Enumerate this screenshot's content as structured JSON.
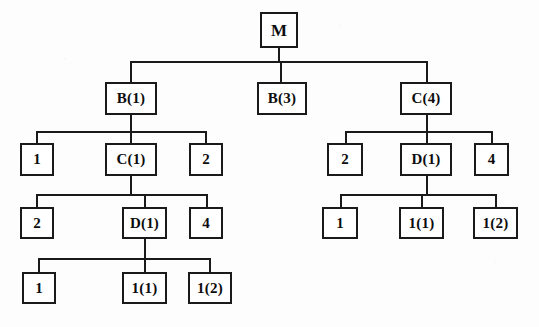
{
  "diagram": {
    "type": "tree",
    "width": 539,
    "height": 327,
    "background_color": "#fdfdfd",
    "line_color": "#1a1a1a",
    "box_fill_color": "#ffffff",
    "text_color": "#0d0d0d",
    "nodes": [
      {
        "id": "m",
        "label": "M",
        "x": 260,
        "y": 12,
        "w": 38,
        "h": 36,
        "font_size": 17
      },
      {
        "id": "b1",
        "label": "B(1)",
        "x": 105,
        "y": 82,
        "w": 52,
        "h": 33,
        "font_size": 15
      },
      {
        "id": "b3",
        "label": "B(3)",
        "x": 257,
        "y": 82,
        "w": 50,
        "h": 33,
        "font_size": 15
      },
      {
        "id": "c4",
        "label": "C(4)",
        "x": 400,
        "y": 82,
        "w": 52,
        "h": 33,
        "font_size": 15
      },
      {
        "id": "l3-1",
        "label": "1",
        "x": 20,
        "y": 143,
        "w": 34,
        "h": 33,
        "font_size": 15
      },
      {
        "id": "c1",
        "label": "C(1)",
        "x": 105,
        "y": 143,
        "w": 52,
        "h": 33,
        "font_size": 15
      },
      {
        "id": "l3-2",
        "label": "2",
        "x": 189,
        "y": 143,
        "w": 34,
        "h": 33,
        "font_size": 15
      },
      {
        "id": "l4-2",
        "label": "2",
        "x": 20,
        "y": 207,
        "w": 34,
        "h": 32,
        "font_size": 15
      },
      {
        "id": "d1-left",
        "label": "D(1)",
        "x": 122,
        "y": 207,
        "w": 45,
        "h": 32,
        "font_size": 15
      },
      {
        "id": "l4-4",
        "label": "4",
        "x": 189,
        "y": 207,
        "w": 34,
        "h": 32,
        "font_size": 15
      },
      {
        "id": "l5-1",
        "label": "1",
        "x": 22,
        "y": 272,
        "w": 34,
        "h": 32,
        "font_size": 15
      },
      {
        "id": "l5-11",
        "label": "1(1)",
        "x": 122,
        "y": 272,
        "w": 45,
        "h": 32,
        "font_size": 15
      },
      {
        "id": "l5-12",
        "label": "1(2)",
        "x": 188,
        "y": 272,
        "w": 44,
        "h": 32,
        "font_size": 15
      },
      {
        "id": "r3-2",
        "label": "2",
        "x": 327,
        "y": 143,
        "w": 36,
        "h": 33,
        "font_size": 15
      },
      {
        "id": "d1-right",
        "label": "D(1)",
        "x": 400,
        "y": 143,
        "w": 52,
        "h": 33,
        "font_size": 15
      },
      {
        "id": "r3-4",
        "label": "4",
        "x": 474,
        "y": 143,
        "w": 35,
        "h": 33,
        "font_size": 15
      },
      {
        "id": "r4-1",
        "label": "1",
        "x": 322,
        "y": 207,
        "w": 36,
        "h": 32,
        "font_size": 15
      },
      {
        "id": "r4-11",
        "label": "1(1)",
        "x": 399,
        "y": 207,
        "w": 45,
        "h": 32,
        "font_size": 15
      },
      {
        "id": "r4-12",
        "label": "1(2)",
        "x": 473,
        "y": 207,
        "w": 45,
        "h": 32,
        "font_size": 15
      }
    ],
    "edges": [
      {
        "id": "m-stub",
        "orient": "v",
        "x": 278,
        "y": 48,
        "len": 14
      },
      {
        "id": "m-bus",
        "orient": "h",
        "x": 130,
        "y": 61,
        "len": 298
      },
      {
        "id": "m-drop-b1",
        "orient": "v",
        "x": 130,
        "y": 61,
        "len": 22
      },
      {
        "id": "m-drop-b3",
        "orient": "v",
        "x": 280,
        "y": 61,
        "len": 22
      },
      {
        "id": "m-drop-c4",
        "orient": "v",
        "x": 426,
        "y": 61,
        "len": 22
      },
      {
        "id": "b1-stub",
        "orient": "v",
        "x": 130,
        "y": 115,
        "len": 16
      },
      {
        "id": "b1-bus",
        "orient": "h",
        "x": 36,
        "y": 131,
        "len": 170
      },
      {
        "id": "b1-drop-1",
        "orient": "v",
        "x": 36,
        "y": 131,
        "len": 13
      },
      {
        "id": "b1-drop-c1",
        "orient": "v",
        "x": 130,
        "y": 131,
        "len": 13
      },
      {
        "id": "b1-drop-2",
        "orient": "v",
        "x": 205,
        "y": 131,
        "len": 13
      },
      {
        "id": "c1-stub",
        "orient": "v",
        "x": 130,
        "y": 176,
        "len": 19
      },
      {
        "id": "c1-bus",
        "orient": "h",
        "x": 36,
        "y": 194,
        "len": 172
      },
      {
        "id": "c1-drop-2",
        "orient": "v",
        "x": 36,
        "y": 194,
        "len": 14
      },
      {
        "id": "c1-drop-d1",
        "orient": "v",
        "x": 144,
        "y": 194,
        "len": 14
      },
      {
        "id": "c1-drop-4",
        "orient": "v",
        "x": 206,
        "y": 194,
        "len": 14
      },
      {
        "id": "dl-stub",
        "orient": "v",
        "x": 144,
        "y": 239,
        "len": 20
      },
      {
        "id": "dl-bus",
        "orient": "h",
        "x": 38,
        "y": 258,
        "len": 172
      },
      {
        "id": "dl-drop-1",
        "orient": "v",
        "x": 38,
        "y": 258,
        "len": 15
      },
      {
        "id": "dl-drop-11",
        "orient": "v",
        "x": 144,
        "y": 258,
        "len": 15
      },
      {
        "id": "dl-drop-12",
        "orient": "v",
        "x": 209,
        "y": 258,
        "len": 15
      },
      {
        "id": "c4-stub",
        "orient": "v",
        "x": 426,
        "y": 115,
        "len": 16
      },
      {
        "id": "c4-bus",
        "orient": "h",
        "x": 345,
        "y": 131,
        "len": 147
      },
      {
        "id": "c4-drop-2",
        "orient": "v",
        "x": 345,
        "y": 131,
        "len": 13
      },
      {
        "id": "c4-drop-d1",
        "orient": "v",
        "x": 426,
        "y": 131,
        "len": 13
      },
      {
        "id": "c4-drop-4",
        "orient": "v",
        "x": 491,
        "y": 131,
        "len": 13
      },
      {
        "id": "dr-stub",
        "orient": "v",
        "x": 426,
        "y": 176,
        "len": 19
      },
      {
        "id": "dr-bus",
        "orient": "h",
        "x": 340,
        "y": 194,
        "len": 156
      },
      {
        "id": "dr-drop-1",
        "orient": "v",
        "x": 340,
        "y": 194,
        "len": 14
      },
      {
        "id": "dr-drop-11",
        "orient": "v",
        "x": 421,
        "y": 194,
        "len": 14
      },
      {
        "id": "dr-drop-12",
        "orient": "v",
        "x": 495,
        "y": 194,
        "len": 14
      }
    ]
  }
}
